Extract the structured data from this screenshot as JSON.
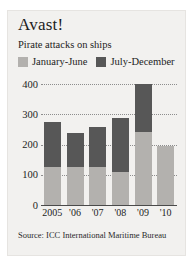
{
  "figure": {
    "title": "Avast!",
    "subtitle": "Pirate attacks on ships",
    "source": "Source: ICC International Maritime Bureau",
    "colors": {
      "series_jan_jun": "#b3b1ae",
      "series_jul_dec": "#575757",
      "background": "#f2f1ef",
      "gridline": "#8d8d8d",
      "axis": "#4a4a4a",
      "text": "#1d1d1d"
    }
  },
  "legend": {
    "position": "top-left",
    "entries": [
      {
        "label": "January-June",
        "color": "#b3b1ae"
      },
      {
        "label": "July-December",
        "color": "#575757"
      }
    ]
  },
  "axes": {
    "y_ticks": [
      "400",
      "300",
      "200",
      "100",
      "0"
    ],
    "x_ticks": [
      "2005",
      "'06",
      "'07",
      "'08",
      "'09",
      "'10"
    ]
  },
  "chart_data": {
    "type": "bar",
    "title": "Avast!",
    "subtitle": "Pirate attacks on ships",
    "stacked": true,
    "xlabel": "",
    "ylabel": "",
    "ylim": [
      0,
      400
    ],
    "yticks": [
      0,
      100,
      200,
      300,
      400
    ],
    "grid": true,
    "legend_position": "top-left",
    "categories": [
      "2005",
      "'06",
      "'07",
      "'08",
      "'09",
      "'10"
    ],
    "series": [
      {
        "name": "January-June",
        "color": "#b3b1ae",
        "values": [
          125,
          127,
          126,
          110,
          240,
          196
        ]
      },
      {
        "name": "July-December",
        "color": "#575757",
        "values": [
          151,
          112,
          133,
          179,
          160,
          0
        ]
      }
    ],
    "totals": [
      276,
      239,
      259,
      289,
      400,
      196
    ],
    "annotations": [],
    "source": "Source: ICC International Maritime Bureau"
  }
}
